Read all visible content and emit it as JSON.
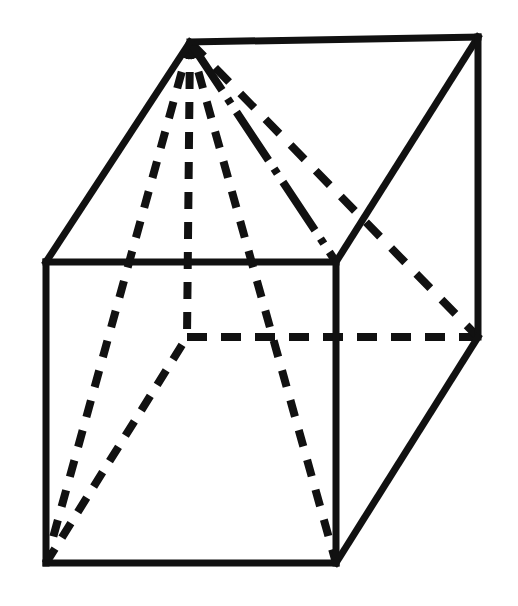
{
  "figure": {
    "canvas": {
      "width": 518,
      "height": 606
    },
    "style": {
      "background_color": "#ffffff",
      "stroke_color": "#111111",
      "solid_stroke_width": 7,
      "dashed_stroke_width": 8,
      "dash_pattern": "17 13",
      "dash_pattern_long": "20 14",
      "dash_pattern_short": "14 11"
    },
    "vertices": {
      "front_top_left": {
        "label": "front-top-left",
        "x": 46,
        "y": 262
      },
      "front_top_right": {
        "label": "front-top-right",
        "x": 336,
        "y": 262
      },
      "front_bottom_left": {
        "label": "front-bottom-left",
        "x": 46,
        "y": 563
      },
      "front_bottom_right": {
        "label": "front-bottom-right",
        "x": 336,
        "y": 563
      },
      "back_top_left": {
        "label": "back-top-left-apex",
        "x": 190,
        "y": 42
      },
      "back_top_right": {
        "label": "back-top-right",
        "x": 478,
        "y": 37
      },
      "back_bottom_left": {
        "label": "back-bottom-left",
        "x": 187,
        "y": 337
      },
      "back_bottom_right": {
        "label": "back-bottom-right",
        "x": 478,
        "y": 337
      }
    },
    "solid_edges": [
      {
        "name": "front-top-edge",
        "x1": 46,
        "y1": 262,
        "x2": 336,
        "y2": 262
      },
      {
        "name": "front-left-edge",
        "x1": 46,
        "y1": 262,
        "x2": 46,
        "y2": 563
      },
      {
        "name": "front-right-edge",
        "x1": 336,
        "y1": 262,
        "x2": 336,
        "y2": 563
      },
      {
        "name": "front-bottom-edge",
        "x1": 46,
        "y1": 563,
        "x2": 336,
        "y2": 563
      },
      {
        "name": "back-top-edge",
        "x1": 190,
        "y1": 42,
        "x2": 478,
        "y2": 37
      },
      {
        "name": "top-left-diagonal",
        "x1": 46,
        "y1": 262,
        "x2": 190,
        "y2": 42
      },
      {
        "name": "top-right-diagonal",
        "x1": 336,
        "y1": 262,
        "x2": 478,
        "y2": 37
      },
      {
        "name": "back-right-edge",
        "x1": 478,
        "y1": 37,
        "x2": 478,
        "y2": 337
      },
      {
        "name": "bottom-right-diagonal",
        "x1": 336,
        "y1": 563,
        "x2": 478,
        "y2": 337
      }
    ],
    "dashed_edges": [
      {
        "name": "back-bottom-edge-hidden",
        "x1": 187,
        "y1": 337,
        "x2": 478,
        "y2": 337
      },
      {
        "name": "back-left-vertical-hidden",
        "x1": 190,
        "y1": 42,
        "x2": 187,
        "y2": 337
      },
      {
        "name": "bottom-left-diagonal-hidden",
        "x1": 46,
        "y1": 563,
        "x2": 187,
        "y2": 337
      }
    ],
    "pyramid_edges": [
      {
        "name": "apex-to-front-bottom-left",
        "x1": 190,
        "y1": 42,
        "x2": 46,
        "y2": 563,
        "style": "dashed"
      },
      {
        "name": "apex-to-front-bottom-right",
        "x1": 190,
        "y1": 42,
        "x2": 336,
        "y2": 563,
        "style": "dashed"
      },
      {
        "name": "apex-to-front-top-right",
        "x1": 190,
        "y1": 42,
        "x2": 336,
        "y2": 262,
        "style": "dashdot"
      },
      {
        "name": "apex-to-back-bottom-right",
        "x1": 190,
        "y1": 42,
        "x2": 478,
        "y2": 337,
        "style": "dashed"
      }
    ]
  }
}
